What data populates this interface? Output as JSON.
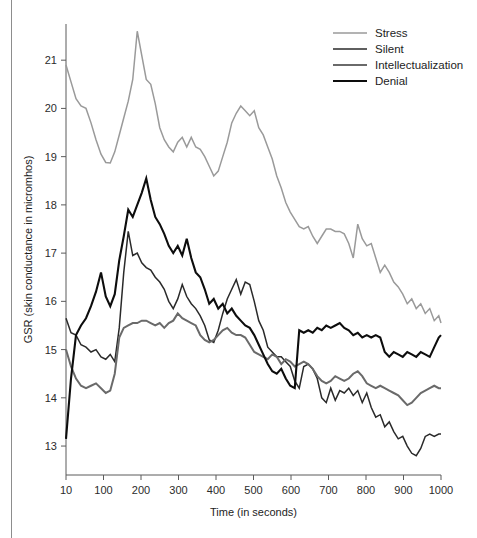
{
  "chart_data": {
    "type": "line",
    "title": "",
    "xlabel": "Time (in seconds)",
    "ylabel": "GSR (skin conductance in micromhos)",
    "xlim": [
      10,
      1000
    ],
    "ylim": [
      12.4,
      21.75
    ],
    "grid": false,
    "legend_position": "top-right",
    "xticks": [
      10,
      100,
      200,
      300,
      400,
      500,
      600,
      700,
      800,
      900,
      1000
    ],
    "xtick_labels": [
      "10",
      "100",
      "200",
      "300",
      "400",
      "500",
      "600",
      "700",
      "800",
      "900",
      "1000"
    ],
    "yticks": [
      13,
      14,
      15,
      16,
      17,
      18,
      19,
      20,
      21
    ],
    "ytick_labels": [
      "13",
      "14",
      "15",
      "16",
      "17",
      "18",
      "19",
      "20",
      "21"
    ],
    "series": [
      {
        "name": "Stress",
        "color": "#9a9a9a",
        "width": 1.5,
        "x": [
          10,
          22,
          34,
          46,
          58,
          70,
          82,
          94,
          106,
          118,
          130,
          142,
          154,
          166,
          178,
          190,
          202,
          214,
          226,
          238,
          250,
          262,
          274,
          286,
          298,
          310,
          322,
          334,
          346,
          358,
          370,
          382,
          394,
          406,
          418,
          430,
          442,
          454,
          466,
          478,
          490,
          502,
          514,
          526,
          538,
          550,
          562,
          574,
          586,
          598,
          610,
          622,
          634,
          646,
          658,
          670,
          682,
          694,
          706,
          718,
          730,
          742,
          754,
          766,
          778,
          790,
          802,
          814,
          826,
          838,
          850,
          862,
          874,
          886,
          898,
          910,
          922,
          934,
          946,
          958,
          970,
          982,
          994,
          1000
        ],
        "y": [
          20.9,
          20.55,
          20.2,
          20.05,
          20.0,
          19.7,
          19.35,
          19.05,
          18.88,
          18.87,
          19.1,
          19.45,
          19.8,
          20.15,
          20.6,
          21.6,
          21.1,
          20.6,
          20.5,
          20.1,
          19.6,
          19.35,
          19.2,
          19.1,
          19.3,
          19.4,
          19.2,
          19.4,
          19.2,
          19.15,
          19.0,
          18.8,
          18.6,
          18.7,
          19.0,
          19.3,
          19.7,
          19.9,
          20.05,
          19.95,
          19.85,
          19.95,
          19.6,
          19.45,
          19.2,
          18.95,
          18.6,
          18.35,
          18.05,
          17.85,
          17.7,
          17.55,
          17.5,
          17.55,
          17.35,
          17.2,
          17.35,
          17.5,
          17.5,
          17.45,
          17.45,
          17.4,
          17.2,
          16.9,
          17.6,
          17.3,
          17.15,
          17.2,
          16.9,
          16.6,
          16.75,
          16.6,
          16.4,
          16.3,
          16.15,
          15.95,
          16.05,
          15.85,
          15.95,
          15.75,
          15.85,
          15.6,
          15.7,
          15.55
        ]
      },
      {
        "name": "Silent",
        "color": "#2a2a2a",
        "width": 1.5,
        "x": [
          10,
          22,
          34,
          46,
          58,
          70,
          82,
          94,
          106,
          118,
          130,
          142,
          154,
          166,
          178,
          190,
          202,
          214,
          226,
          238,
          250,
          262,
          274,
          286,
          298,
          310,
          322,
          334,
          346,
          358,
          370,
          382,
          394,
          406,
          418,
          430,
          442,
          454,
          466,
          478,
          490,
          502,
          514,
          526,
          538,
          550,
          562,
          574,
          586,
          598,
          610,
          622,
          634,
          646,
          658,
          670,
          682,
          694,
          706,
          718,
          730,
          742,
          754,
          766,
          778,
          790,
          802,
          814,
          826,
          838,
          850,
          862,
          874,
          886,
          898,
          910,
          922,
          934,
          946,
          958,
          970,
          982,
          994,
          1000
        ],
        "y": [
          15.65,
          15.35,
          15.3,
          15.1,
          15.05,
          14.95,
          15.0,
          14.85,
          14.8,
          14.9,
          14.75,
          15.45,
          16.6,
          17.45,
          16.95,
          17.0,
          16.8,
          16.7,
          16.65,
          16.5,
          16.4,
          16.25,
          16.0,
          15.85,
          16.05,
          16.35,
          16.1,
          15.95,
          15.85,
          15.7,
          15.5,
          15.2,
          15.15,
          15.4,
          15.75,
          16.05,
          16.25,
          16.45,
          16.15,
          16.4,
          16.35,
          16.0,
          15.6,
          15.4,
          15.05,
          14.95,
          14.85,
          14.85,
          14.75,
          14.65,
          14.35,
          14.2,
          14.65,
          14.7,
          14.6,
          14.4,
          14.0,
          13.9,
          14.2,
          13.95,
          14.15,
          14.1,
          14.2,
          14.05,
          14.15,
          13.9,
          14.1,
          13.8,
          13.6,
          13.65,
          13.4,
          13.5,
          13.3,
          13.15,
          13.2,
          13.0,
          12.85,
          12.8,
          12.95,
          13.2,
          13.25,
          13.2,
          13.25,
          13.25
        ]
      },
      {
        "name": "Intellectualization",
        "color": "#6a6a6a",
        "width": 2,
        "x": [
          10,
          22,
          34,
          46,
          58,
          70,
          82,
          94,
          106,
          118,
          130,
          142,
          154,
          166,
          178,
          190,
          202,
          214,
          226,
          238,
          250,
          262,
          274,
          286,
          298,
          310,
          322,
          334,
          346,
          358,
          370,
          382,
          394,
          406,
          418,
          430,
          442,
          454,
          466,
          478,
          490,
          502,
          514,
          526,
          538,
          550,
          562,
          574,
          586,
          598,
          610,
          622,
          634,
          646,
          658,
          670,
          682,
          694,
          706,
          718,
          730,
          742,
          754,
          766,
          778,
          790,
          802,
          814,
          826,
          838,
          850,
          862,
          874,
          886,
          898,
          910,
          922,
          934,
          946,
          958,
          970,
          982,
          994,
          1000
        ],
        "y": [
          15.0,
          14.65,
          14.4,
          14.25,
          14.2,
          14.25,
          14.3,
          14.2,
          14.1,
          14.15,
          14.5,
          15.25,
          15.45,
          15.5,
          15.55,
          15.55,
          15.6,
          15.6,
          15.55,
          15.5,
          15.55,
          15.45,
          15.55,
          15.6,
          15.75,
          15.65,
          15.6,
          15.55,
          15.5,
          15.3,
          15.2,
          15.15,
          15.2,
          15.3,
          15.4,
          15.45,
          15.35,
          15.3,
          15.3,
          15.25,
          15.1,
          14.95,
          14.9,
          14.85,
          14.8,
          14.9,
          14.85,
          14.7,
          14.8,
          14.75,
          14.65,
          14.7,
          14.75,
          14.7,
          14.6,
          14.45,
          14.35,
          14.3,
          14.35,
          14.45,
          14.4,
          14.35,
          14.4,
          14.5,
          14.55,
          14.45,
          14.3,
          14.25,
          14.2,
          14.25,
          14.2,
          14.15,
          14.1,
          14.05,
          13.95,
          13.85,
          13.9,
          14.0,
          14.1,
          14.15,
          14.2,
          14.25,
          14.2,
          14.2
        ]
      },
      {
        "name": "Denial",
        "color": "#0d0d0d",
        "width": 2.1,
        "x": [
          10,
          22,
          34,
          46,
          58,
          70,
          82,
          94,
          106,
          118,
          130,
          142,
          154,
          166,
          178,
          190,
          202,
          214,
          226,
          238,
          250,
          262,
          274,
          286,
          298,
          310,
          322,
          334,
          346,
          358,
          370,
          382,
          394,
          406,
          418,
          430,
          442,
          454,
          466,
          478,
          490,
          502,
          514,
          526,
          538,
          550,
          562,
          574,
          586,
          598,
          610,
          622,
          634,
          646,
          658,
          670,
          682,
          694,
          706,
          718,
          730,
          742,
          754,
          766,
          778,
          790,
          802,
          814,
          826,
          838,
          850,
          862,
          874,
          886,
          898,
          910,
          922,
          934,
          946,
          958,
          970,
          982,
          994,
          1000
        ],
        "y": [
          13.15,
          14.4,
          15.3,
          15.5,
          15.65,
          15.9,
          16.2,
          16.6,
          16.1,
          15.9,
          16.15,
          16.85,
          17.35,
          17.9,
          17.75,
          18.0,
          18.25,
          18.55,
          18.1,
          17.75,
          17.6,
          17.4,
          17.15,
          17.0,
          17.15,
          16.95,
          17.3,
          16.9,
          16.6,
          16.5,
          16.25,
          15.95,
          16.05,
          15.85,
          15.95,
          15.75,
          15.85,
          15.7,
          15.6,
          15.5,
          15.45,
          15.3,
          15.1,
          14.9,
          14.7,
          14.55,
          14.5,
          14.6,
          14.4,
          14.25,
          14.2,
          15.4,
          15.35,
          15.4,
          15.35,
          15.45,
          15.4,
          15.5,
          15.45,
          15.5,
          15.55,
          15.45,
          15.4,
          15.3,
          15.35,
          15.25,
          15.3,
          15.25,
          15.3,
          15.25,
          14.95,
          14.85,
          14.95,
          14.9,
          14.85,
          14.95,
          14.9,
          14.85,
          14.95,
          14.9,
          14.85,
          15.05,
          15.25,
          15.3
        ]
      }
    ]
  },
  "legend": {
    "entries": [
      {
        "label": "Stress"
      },
      {
        "label": "Silent"
      },
      {
        "label": "Intellectualization"
      },
      {
        "label": "Denial"
      }
    ]
  }
}
